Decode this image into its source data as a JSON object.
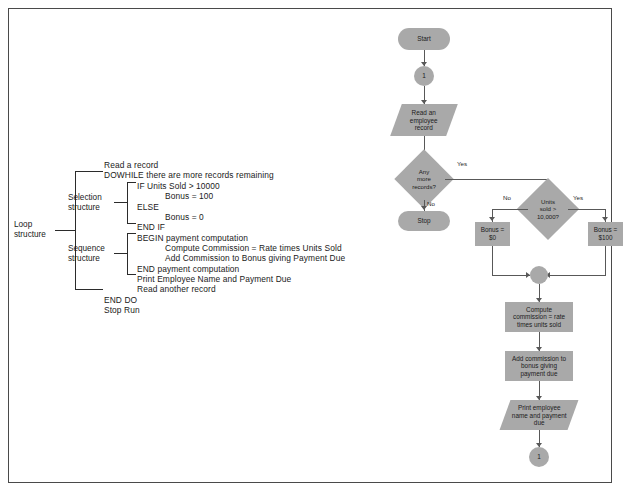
{
  "page": {
    "border_color": "#4a4a4a",
    "background": "#ffffff",
    "shape_fill": "#a9a9a9",
    "line_color": "#585858"
  },
  "pseudocode": {
    "structure_labels": {
      "loop": "Loop\nstructure",
      "selection": "Selection\nstructure",
      "sequence": "Sequence\nstructure"
    },
    "lines": [
      {
        "text": "Read a record",
        "indent": 0
      },
      {
        "text": "DOWHILE there are more records remaining",
        "indent": 0
      },
      {
        "text": "IF Units Sold > 10000",
        "indent": 1
      },
      {
        "text": "Bonus = 100",
        "indent": 2
      },
      {
        "text": "ELSE",
        "indent": 1
      },
      {
        "text": "Bonus = 0",
        "indent": 2
      },
      {
        "text": "END IF",
        "indent": 1
      },
      {
        "text": "BEGIN payment computation",
        "indent": 1
      },
      {
        "text": "Compute Commission = Rate times Units Sold",
        "indent": 2
      },
      {
        "text": "Add Commission to Bonus giving Payment Due",
        "indent": 2
      },
      {
        "text": "END payment computation",
        "indent": 1
      },
      {
        "text": "Print Employee Name and Payment Due",
        "indent": 1
      },
      {
        "text": "Read another record",
        "indent": 1
      },
      {
        "text": "END DO",
        "indent": 0
      },
      {
        "text": "Stop Run",
        "indent": 0
      }
    ]
  },
  "flowchart": {
    "nodes": {
      "start": {
        "label": "Start",
        "type": "terminal"
      },
      "connector_top": {
        "label": "1",
        "type": "connector"
      },
      "read_record": {
        "label": "Read an\nemployee\nrecord",
        "type": "io"
      },
      "any_more": {
        "label": "Any\nmore\nrecords?",
        "type": "decision"
      },
      "stop": {
        "label": "Stop",
        "type": "terminal"
      },
      "units_sold": {
        "label": "Units\nsold >\n10,000?",
        "type": "decision"
      },
      "bonus_zero": {
        "label": "Bonus =\n$0",
        "type": "process"
      },
      "bonus_hundred": {
        "label": "Bonus =\n$100",
        "type": "process"
      },
      "merge": {
        "label": "",
        "type": "merge"
      },
      "compute_comm": {
        "label": "Compute\ncommission = rate\ntimes units sold",
        "type": "process"
      },
      "add_comm": {
        "label": "Add commission to\nbonus giving\npayment due",
        "type": "process"
      },
      "print_emp": {
        "label": "Print employee\nname and payment\ndue",
        "type": "io"
      },
      "connector_bot": {
        "label": "1",
        "type": "connector"
      }
    },
    "edge_labels": {
      "any_more_yes": "Yes",
      "any_more_no": "No",
      "units_no": "No",
      "units_yes": "Yes"
    }
  }
}
